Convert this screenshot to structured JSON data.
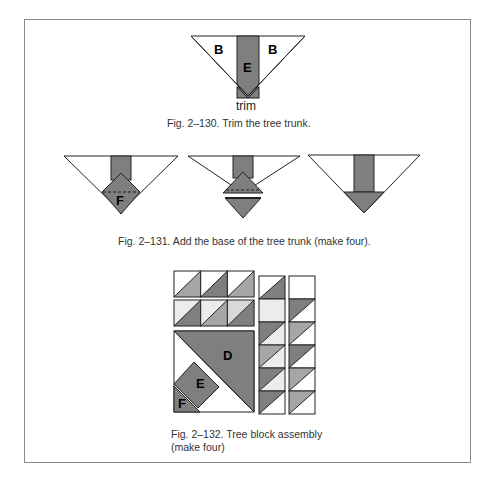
{
  "colors": {
    "dark_gray": "#7f7f7f",
    "medium_gray": "#a6a6a6",
    "light_gray": "#d9d9d9",
    "very_light": "#ececec",
    "white": "#ffffff",
    "outline": "#222222",
    "frame": "#8a8a8a"
  },
  "fig130": {
    "labels": {
      "left": "B",
      "center": "E",
      "right": "B"
    },
    "trim_label": "trim",
    "caption": "Fig. 2–130. Trim the tree trunk."
  },
  "fig131": {
    "panels": [
      {
        "label": "F",
        "step": "diamond-with-fold-line"
      },
      {
        "label": "",
        "step": "fold-and-separate"
      },
      {
        "label": "",
        "step": "completed-base"
      }
    ],
    "caption": "Fig. 2–131. Add the base of the tree trunk (make four)."
  },
  "fig132": {
    "labels": {
      "big_triangle": "D",
      "strip": "E",
      "corner": "F"
    },
    "top_rows": [
      [
        {
          "tl": "white",
          "br": "medium_gray"
        },
        {
          "tl": "white",
          "br": "dark_gray"
        },
        {
          "tl": "white",
          "br": "medium_gray"
        }
      ],
      [
        {
          "tl": "very_light",
          "br": "dark_gray"
        },
        {
          "tl": "very_light",
          "br": "medium_gray"
        },
        {
          "tl": "light_gray",
          "br": "dark_gray"
        }
      ]
    ],
    "side_columns": [
      [
        {
          "tl": "white",
          "br": "dark_gray"
        },
        {
          "tl": "very_light",
          "br": "very_light"
        },
        {
          "tl": "dark_gray",
          "br": "very_light"
        },
        {
          "tl": "medium_gray",
          "br": "very_light"
        },
        {
          "tl": "dark_gray",
          "br": "very_light"
        },
        {
          "tl": "dark_gray",
          "br": "white"
        }
      ],
      [
        {
          "tl": "white",
          "br": "white"
        },
        {
          "tl": "dark_gray",
          "br": "white"
        },
        {
          "tl": "medium_gray",
          "br": "white"
        },
        {
          "tl": "dark_gray",
          "br": "white"
        },
        {
          "tl": "medium_gray",
          "br": "white"
        },
        {
          "tl": "medium_gray",
          "br": "white"
        }
      ]
    ],
    "caption_line1": "Fig. 2–132. Tree block assembly",
    "caption_line2": "(make four)"
  }
}
